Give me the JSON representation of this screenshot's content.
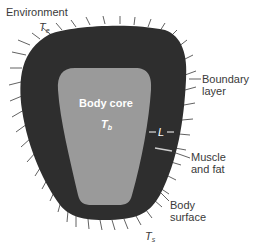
{
  "labels": {
    "environment": "Environment",
    "te_main": "T",
    "te_sub": "e",
    "boundary_line1": "Boundary",
    "boundary_line2": "layer",
    "body_core": "Body core",
    "tb_main": "T",
    "tb_sub": "b",
    "l_label": "L",
    "muscle_line1": "Muscle",
    "muscle_line2": "and fat",
    "surface_line1": "Body",
    "surface_line2": "surface",
    "ts_main": "T",
    "ts_sub": "s"
  },
  "colors": {
    "outer_layer": "#2e2e2e",
    "core": "#9a9a9a",
    "text": "#3a3a3a",
    "background": "#ffffff"
  }
}
